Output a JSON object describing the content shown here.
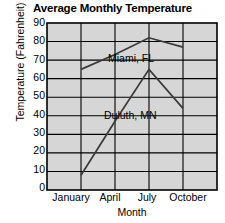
{
  "chart_data": {
    "type": "line",
    "title": "Average Monthly Temperature",
    "xlabel": "Month",
    "ylabel": "Temperature (Fahrenheit)",
    "categories": [
      "January",
      "April",
      "July",
      "October"
    ],
    "x_tick_labels": [
      "January",
      "April",
      "July",
      "October"
    ],
    "y_tick_labels": [
      "0",
      "10",
      "20",
      "30",
      "40",
      "50",
      "60",
      "70",
      "80",
      "90"
    ],
    "y_ticks": [
      0,
      10,
      20,
      30,
      40,
      50,
      60,
      70,
      80,
      90
    ],
    "ylim": [
      0,
      90
    ],
    "grid": true,
    "legend": "inline-labels",
    "plot_background": "#d6d6d6",
    "axis_color": "#000000",
    "grid_color": "#000000",
    "series": [
      {
        "name": "Miami, FL",
        "color": "#3a3a3a",
        "values": [
          65,
          73,
          82,
          77
        ],
        "label_x": 108,
        "label_y": 52
      },
      {
        "name": "Duluth, MN",
        "color": "#3a3a3a",
        "values": [
          8,
          37,
          65,
          44
        ],
        "label_x": 104,
        "label_y": 109
      }
    ]
  },
  "labels": {
    "title": "Average Monthly Temperature",
    "y_axis_title": "Temperature (Fahrenheit)",
    "x_axis_title": "Month",
    "series_miami": "Miami, FL",
    "series_duluth": "Duluth, MN",
    "y_90": "90",
    "y_80": "80",
    "y_70": "70",
    "y_60": "60",
    "y_50": "50",
    "y_40": "40",
    "y_30": "30",
    "y_20": "20",
    "y_10": "10",
    "y_0": "0",
    "x_january": "January",
    "x_april": "April",
    "x_july": "July",
    "x_october": "October"
  }
}
